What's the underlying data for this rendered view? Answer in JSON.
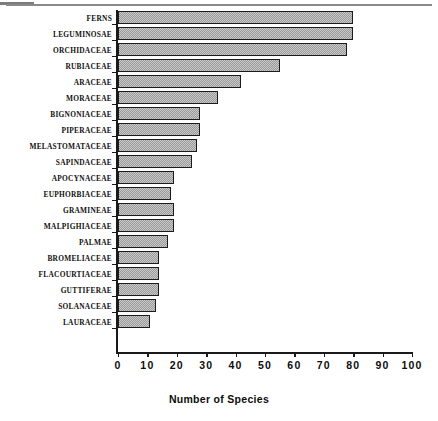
{
  "figure": {
    "top_rule": "page-separator-rule"
  },
  "chart_data": {
    "type": "bar",
    "orientation": "horizontal",
    "title": "",
    "xlabel": "Number of Species",
    "ylabel": "",
    "xlim": [
      0,
      100
    ],
    "xticks": [
      0,
      10,
      20,
      30,
      40,
      50,
      60,
      70,
      80,
      90,
      100
    ],
    "xtick_labels": [
      "0",
      "10",
      "20",
      "30",
      "40",
      "50",
      "60",
      "70",
      "80",
      "90",
      "100"
    ],
    "grid": false,
    "legend": null,
    "bar_fill_color": "#9a9a9a",
    "bar_edge_color": "#1c1c1c",
    "categories": [
      "FERNS",
      "LEGUMINOSAE",
      "ORCHIDACEAE",
      "RUBIACEAE",
      "ARACEAE",
      "MORACEAE",
      "BIGNONIACEAE",
      "PIPERACEAE",
      "MELASTOMATACEAE",
      "SAPINDACEAE",
      "APOCYNACEAE",
      "EUPHORBIACEAE",
      "GRAMINEAE",
      "MALPIGHIACEAE",
      "PALMAE",
      "BROMELIACEAE",
      "FLACOURTIACEAE",
      "GUTTIFERAE",
      "SOLANACEAE",
      "LAURACEAE"
    ],
    "values": [
      80,
      80,
      78,
      55,
      42,
      34,
      28,
      28,
      27,
      25,
      19,
      18,
      19,
      19,
      17,
      14,
      14,
      14,
      13,
      11
    ]
  }
}
